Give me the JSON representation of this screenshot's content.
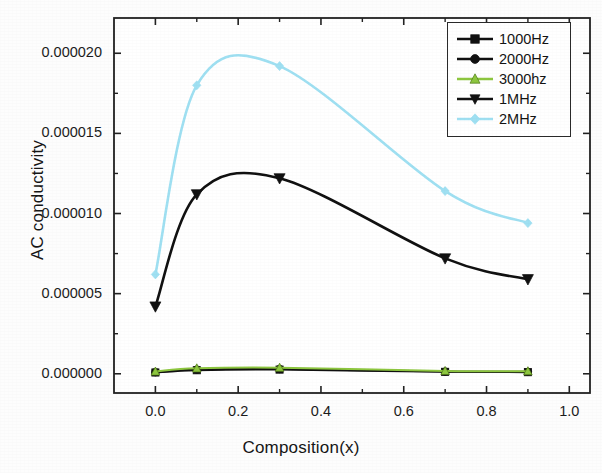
{
  "chart_data": {
    "type": "line",
    "title": "",
    "xlabel": "Composition(x)",
    "ylabel": "AC conductivity",
    "xlim": [
      -0.1,
      1.05
    ],
    "ylim": [
      -1.2e-06,
      2.22e-05
    ],
    "xticks": [
      0.0,
      0.2,
      0.4,
      0.6,
      0.8,
      1.0
    ],
    "xtick_labels": [
      "0.0",
      "0.2",
      "0.4",
      "0.6",
      "0.8",
      "1.0"
    ],
    "yticks": [
      0.0,
      5e-06,
      1e-05,
      1.5e-05,
      2e-05
    ],
    "ytick_labels": [
      "0.000000",
      "0.000005",
      "0.000010",
      "0.000015",
      "0.000020"
    ],
    "grid": false,
    "legend_position": "top-right",
    "x": [
      0.0,
      0.1,
      0.3,
      0.7,
      0.9
    ],
    "series": [
      {
        "name": "1000Hz",
        "marker": "square",
        "color": "#111111",
        "values": [
          8e-08,
          2.2e-07,
          2.6e-07,
          1.2e-07,
          1e-07
        ]
      },
      {
        "name": "2000Hz",
        "marker": "circle",
        "color": "#111111",
        "values": [
          1e-07,
          2.6e-07,
          3e-07,
          1.4e-07,
          1.2e-07
        ]
      },
      {
        "name": "3000hz",
        "marker": "triangle-up",
        "color": "#8dc63f",
        "values": [
          1.4e-07,
          3.4e-07,
          3.8e-07,
          1.8e-07,
          1.6e-07
        ]
      },
      {
        "name": "1MHz",
        "marker": "triangle-down",
        "color": "#111111",
        "values": [
          4.2e-06,
          1.12e-05,
          1.22e-05,
          7.2e-06,
          5.9e-06
        ]
      },
      {
        "name": "2MHz",
        "marker": "diamond",
        "color": "#9fe0f2",
        "values": [
          6.2e-06,
          1.8e-05,
          1.92e-05,
          1.14e-05,
          9.4e-06
        ]
      }
    ]
  },
  "legend": {
    "entries": [
      {
        "label": "1000Hz"
      },
      {
        "label": "2000Hz"
      },
      {
        "label": "3000hz"
      },
      {
        "label": "1MHz"
      },
      {
        "label": "2MHz"
      }
    ]
  }
}
